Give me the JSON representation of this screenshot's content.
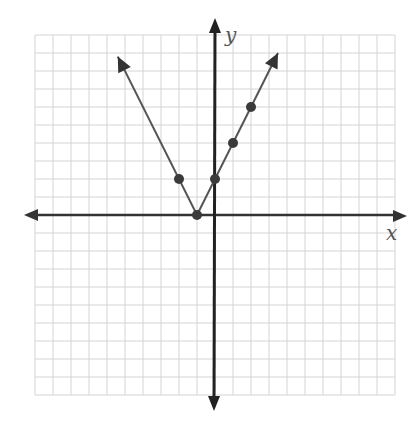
{
  "chart_data": {
    "type": "line",
    "title": "",
    "function": "y = 2|x + 1|",
    "xlabel": "x",
    "ylabel": "y",
    "xlim": [
      -10,
      10
    ],
    "ylim": [
      -10,
      10
    ],
    "grid": true,
    "legend": null,
    "series": [
      {
        "name": "absolute value graph",
        "points": [
          {
            "x": -2,
            "y": 2
          },
          {
            "x": -1,
            "y": 0
          },
          {
            "x": 0,
            "y": 2
          },
          {
            "x": 1,
            "y": 4
          },
          {
            "x": 2,
            "y": 6
          }
        ],
        "line_from": {
          "x": -5.4,
          "y": 8.8
        },
        "vertex": {
          "x": -1,
          "y": 0
        },
        "line_to": {
          "x": 3.5,
          "y": 9
        }
      }
    ]
  },
  "labels": {
    "x_axis": "x",
    "y_axis": "y"
  },
  "colors": {
    "grid": "#d4d4d4",
    "axis": "#333333",
    "line": "#555555",
    "point": "#3a3a3a"
  }
}
